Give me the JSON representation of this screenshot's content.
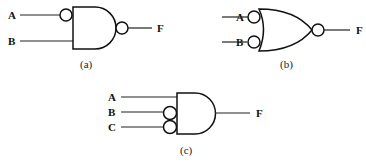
{
  "diagram": {
    "type": "logic-gates",
    "gates": [
      {
        "id": "a",
        "caption": "(a)",
        "gate_type": "AND",
        "inputs": [
          {
            "label": "A",
            "inverted": true
          },
          {
            "label": "B",
            "inverted": false
          }
        ],
        "output": {
          "label": "F",
          "inverted": true
        }
      },
      {
        "id": "b",
        "caption": "(b)",
        "gate_type": "OR",
        "inputs": [
          {
            "label": "A",
            "inverted": true
          },
          {
            "label": "B",
            "inverted": true
          }
        ],
        "output": {
          "label": "F",
          "inverted": true
        }
      },
      {
        "id": "c",
        "caption": "(c)",
        "gate_type": "AND",
        "inputs": [
          {
            "label": "A",
            "inverted": false
          },
          {
            "label": "B",
            "inverted": true
          },
          {
            "label": "C",
            "inverted": true
          }
        ],
        "output": {
          "label": "F",
          "inverted": false
        }
      }
    ]
  }
}
